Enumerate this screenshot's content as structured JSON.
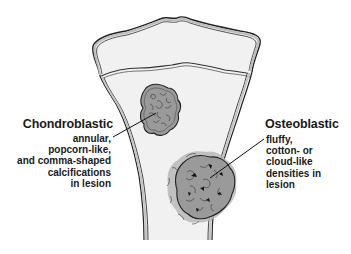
{
  "figure": {
    "background_color": "#ffffff",
    "bone_fill_color": "#f1f1f1",
    "outline_color": "#222222",
    "cortex_color": "#bdbdbd",
    "lesion_fill_color": "#9a9a9a"
  },
  "labels": {
    "chondroblastic": {
      "title": "Chondroblastic",
      "lines": [
        "annular,",
        "popcorn-like,",
        "and comma-shaped",
        "calcifications",
        "in lesion"
      ]
    },
    "osteoblastic": {
      "title": "Osteoblastic",
      "lines": [
        "fluffy,",
        "cotton- or",
        "cloud-like",
        "densities in",
        "lesion"
      ]
    }
  }
}
